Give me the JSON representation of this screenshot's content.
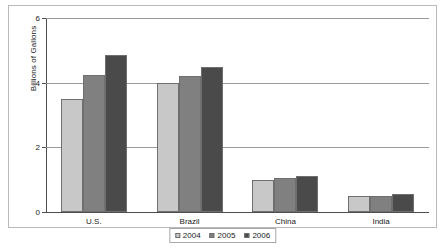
{
  "chart_data": {
    "type": "bar",
    "title": "",
    "subtitle": "",
    "xlabel": "",
    "ylabel": "Billions of Gallons",
    "categories": [
      "U.S.",
      "Brazil",
      "China",
      "India"
    ],
    "series": [
      {
        "name": "2004",
        "color": "#c8c8c8",
        "values": [
          3.5,
          4.0,
          1.0,
          0.5
        ]
      },
      {
        "name": "2005",
        "color": "#808080",
        "values": [
          4.25,
          4.2,
          1.05,
          0.48
        ]
      },
      {
        "name": "2006",
        "color": "#4a4a4a",
        "values": [
          4.85,
          4.5,
          1.1,
          0.55
        ]
      }
    ],
    "ylim": [
      0,
      6
    ],
    "yticks": [
      0,
      2,
      4,
      6
    ],
    "ytick_labels": [
      "0",
      "2",
      "4",
      "6"
    ],
    "grid": true,
    "legend_position": "bottom",
    "legend_entries": [
      "2004",
      "2005",
      "2006"
    ],
    "bar_border_color": "#6f6f6f",
    "gridline_color": "#9a9a9a",
    "axis_color": "#4d4d4d",
    "frame_color": "#b9b9b9",
    "background": "#ffffff"
  }
}
